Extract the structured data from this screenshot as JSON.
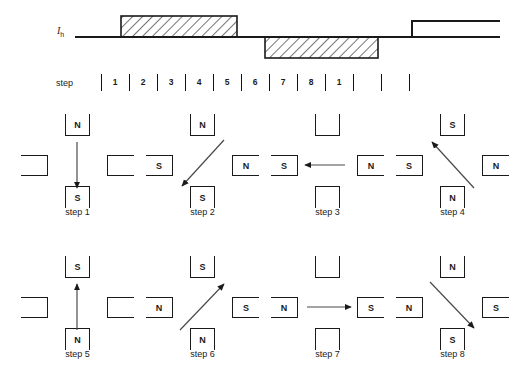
{
  "waveform": {
    "signal_label": "I",
    "signal_subscript": "h",
    "baseline_y": 37,
    "pulses": [
      {
        "name": "positive-pulse",
        "x": 121,
        "width": 116,
        "polarity": "positive",
        "height": 21,
        "hatched": true
      },
      {
        "name": "negative-pulse",
        "x": 265,
        "width": 113,
        "polarity": "negative",
        "height": 21,
        "hatched": true
      },
      {
        "name": "rising-step",
        "x": 412,
        "width": 88,
        "polarity": "positive",
        "height": 16,
        "hatched": false
      }
    ]
  },
  "step_ruler": {
    "label": "step",
    "tick_start_x": 101,
    "tick_spacing": 28,
    "tick_count": 12,
    "numbers": [
      "1",
      "2",
      "3",
      "4",
      "5",
      "6",
      "7",
      "8",
      "1",
      "",
      ""
    ]
  },
  "steps": [
    {
      "id": "step-1",
      "caption": "step 1",
      "top": "N",
      "bottom": "S",
      "left": "",
      "right": "",
      "arrow": "down"
    },
    {
      "id": "step-2",
      "caption": "step 2",
      "top": "N",
      "bottom": "S",
      "left": "S",
      "right": "N",
      "arrow": "down-left"
    },
    {
      "id": "step-3",
      "caption": "step 3",
      "top": "",
      "bottom": "",
      "left": "S",
      "right": "N",
      "arrow": "left"
    },
    {
      "id": "step-4",
      "caption": "step 4",
      "top": "S",
      "bottom": "N",
      "left": "S",
      "right": "N",
      "arrow": "up-left"
    },
    {
      "id": "step-5",
      "caption": "step 5",
      "top": "S",
      "bottom": "N",
      "left": "",
      "right": "",
      "arrow": "up"
    },
    {
      "id": "step-6",
      "caption": "step 6",
      "top": "S",
      "bottom": "N",
      "left": "N",
      "right": "S",
      "arrow": "up-right"
    },
    {
      "id": "step-7",
      "caption": "step 7",
      "top": "",
      "bottom": "",
      "left": "N",
      "right": "S",
      "arrow": "right"
    },
    {
      "id": "step-8",
      "caption": "step 8",
      "top": "N",
      "bottom": "S",
      "left": "N",
      "right": "S",
      "arrow": "down-right"
    }
  ],
  "colors": {
    "line": "#1a1a1a",
    "hatch": "#2a2a2a",
    "background": "#ffffff"
  }
}
